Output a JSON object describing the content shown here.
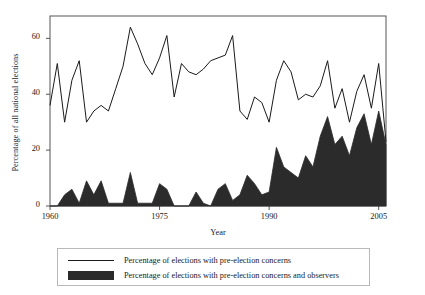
{
  "chart_data": {
    "type": "area",
    "title": "",
    "subtitle": "",
    "xlabel": "Year",
    "ylabel": "Percentage of all national elections",
    "xlim": [
      1960,
      2006
    ],
    "ylim": [
      0,
      68
    ],
    "xticks": [
      1960,
      1975,
      1990,
      2005
    ],
    "yticks": [
      0,
      20,
      40,
      60
    ],
    "grid": false,
    "legend_position": "below-plot",
    "x": [
      1960,
      1961,
      1962,
      1963,
      1964,
      1965,
      1966,
      1967,
      1968,
      1969,
      1970,
      1971,
      1972,
      1973,
      1974,
      1975,
      1976,
      1977,
      1978,
      1979,
      1980,
      1981,
      1982,
      1983,
      1984,
      1985,
      1986,
      1987,
      1988,
      1989,
      1990,
      1991,
      1992,
      1993,
      1994,
      1995,
      1996,
      1997,
      1998,
      1999,
      2000,
      2001,
      2002,
      2003,
      2004,
      2005,
      2006
    ],
    "series": [
      {
        "name": "Percentage of elections with pre-election concerns",
        "style": "line",
        "color": "#1a1a1a",
        "values": [
          36,
          51,
          30,
          45,
          52,
          30,
          34,
          36,
          34,
          42,
          50,
          64,
          58,
          51,
          47,
          53,
          61,
          39,
          51,
          48,
          47,
          49,
          52,
          53,
          54,
          61,
          34,
          31,
          39,
          37,
          30,
          45,
          52,
          48,
          38,
          40,
          39,
          43,
          52,
          35,
          42,
          30,
          41,
          47,
          35,
          51,
          23
        ]
      },
      {
        "name": "Percentage of elections with pre-election concerns and observers",
        "style": "filled-area",
        "color": "#2b2b2b",
        "values": [
          0,
          0,
          4,
          6,
          1,
          9,
          4,
          9,
          1,
          1,
          1,
          12,
          1,
          1,
          1,
          8,
          6,
          0,
          0,
          0,
          5,
          1,
          0,
          6,
          8,
          2,
          4,
          11,
          8,
          4,
          5,
          21,
          14,
          12,
          10,
          18,
          14,
          25,
          32,
          22,
          25,
          18,
          28,
          33,
          22,
          34,
          22
        ]
      }
    ]
  },
  "axes": {
    "xticklabels": [
      "1960",
      "1975",
      "1990",
      "2005"
    ],
    "yticklabels": [
      "0",
      "20",
      "40",
      "60"
    ],
    "xlabel": "Year",
    "ylabel": "Percentage of all national elections"
  },
  "legend": {
    "items": [
      {
        "label": "Percentage of  elections with pre-election concerns",
        "marker": "line-swatch"
      },
      {
        "label": "Percentage of  elections with pre-election concerns and observers",
        "marker": "filled-box-swatch"
      }
    ]
  },
  "colors": {
    "line": "#1a1a1a",
    "area_fill": "#2b2b2b",
    "frame": "#555555",
    "background": "#ffffff",
    "legend_border": "#b9b9b9"
  }
}
